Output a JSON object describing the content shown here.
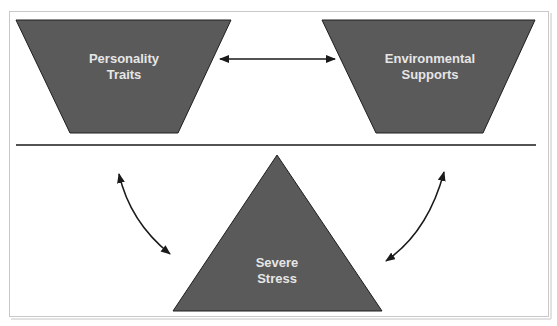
{
  "diagram": {
    "colors": {
      "shape_fill": "#5a5a5a",
      "shape_stroke": "#1e1e1e",
      "label_text": "#e6e6e6",
      "line": "#1a1a1a",
      "frame": "#c8c8c8",
      "background": "#ffffff"
    },
    "nodes": {
      "personality": {
        "line1": "Personality",
        "line2": "Traits",
        "shape": "inverted-trapezoid"
      },
      "environment": {
        "line1": "Environmental",
        "line2": "Supports",
        "shape": "inverted-trapezoid"
      },
      "stress": {
        "line1": "Severe",
        "line2": "Stress",
        "shape": "triangle"
      }
    },
    "edges": [
      {
        "from": "personality",
        "to": "environment",
        "type": "bidirectional-straight"
      },
      {
        "from": "personality",
        "to": "stress",
        "type": "bidirectional-curved"
      },
      {
        "from": "environment",
        "to": "stress",
        "type": "bidirectional-curved"
      }
    ],
    "divider": "horizontal-rule"
  }
}
